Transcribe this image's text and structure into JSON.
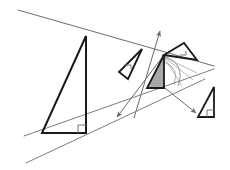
{
  "canvas": {
    "width": 230,
    "height": 170,
    "background": "#ffffff",
    "title": "Geometric transformation diagram with right triangles"
  },
  "style": {
    "stroke_dark": "#1a1a1a",
    "stroke_mid": "#555555",
    "stroke_light": "#7a7a7a",
    "shade_fill": "#a8a8a8",
    "shade_stroke": "#1a1a1a",
    "marker_stroke": "#777777",
    "thick_width": 2.0,
    "thin_width": 0.8,
    "hair_width": 0.6
  },
  "construction_lines": [
    {
      "name": "upper-guide-line",
      "x1": 18,
      "y1": 10,
      "x2": 214,
      "y2": 66,
      "color": "#5a5a5a",
      "width": 0.9
    },
    {
      "name": "lower-guide-line-upper",
      "x1": 24,
      "y1": 136,
      "x2": 214,
      "y2": 69,
      "color": "#6e6e6e",
      "width": 0.9
    },
    {
      "name": "lower-guide-line-lower",
      "x1": 26,
      "y1": 163,
      "x2": 205,
      "y2": 79,
      "color": "#6e6e6e",
      "width": 0.9
    }
  ],
  "triangles": [
    {
      "name": "large-left-triangle",
      "points": "42,133 86,133 86,36",
      "fill": "none",
      "stroke": "#1a1a1a",
      "width": 2.0,
      "right_angle": {
        "corner_x": 86,
        "corner_y": 133,
        "dx": -8,
        "dy": -8
      }
    },
    {
      "name": "small-outlined-triangle-left",
      "points": "119,72 142,49 128,79",
      "fill": "none",
      "stroke": "#1a1a1a",
      "width": 1.8,
      "right_angle": {
        "corner_x": 124,
        "corner_y": 69,
        "dx": 7,
        "dy": -4
      }
    },
    {
      "name": "shaded-center-triangle",
      "points": "147,88 164,88 164,55",
      "fill": "#a8a8a8",
      "stroke": "#1a1a1a",
      "width": 1.8,
      "right_angle": null
    },
    {
      "name": "tilted-upper-right-triangle",
      "points": "164,55 197,60 184,43",
      "fill": "none",
      "stroke": "#1a1a1a",
      "width": 1.8,
      "right_angle": {
        "corner_x": 180,
        "corner_y": 51,
        "dx": 6,
        "dy": 4
      }
    },
    {
      "name": "small-bottom-right-triangle",
      "points": "198,117 214,117 214,87",
      "fill": "none",
      "stroke": "#1a1a1a",
      "width": 1.8,
      "right_angle": {
        "corner_x": 214,
        "corner_y": 117,
        "dx": -7,
        "dy": -7
      }
    }
  ],
  "arrows": [
    {
      "name": "arrow-up-translation",
      "x1": 134,
      "y1": 118,
      "x2": 160,
      "y2": 31,
      "color": "#6b6b6b",
      "width": 1.0
    },
    {
      "name": "arrow-down-left-translation",
      "x1": 164,
      "y1": 55,
      "x2": 117,
      "y2": 117,
      "color": "#6b6b6b",
      "width": 1.0
    },
    {
      "name": "arrow-down-right-translation",
      "x1": 160,
      "y1": 84,
      "x2": 196,
      "y2": 113,
      "color": "#6b6b6b",
      "width": 1.0
    }
  ],
  "arcs": [
    {
      "name": "rotation-arc-outer",
      "path": "M 164,56 Q 186,64 178,86",
      "color": "#7a7a7a",
      "width": 0.8
    },
    {
      "name": "rotation-arc-inner",
      "path": "M 164,62 Q 180,68 174,84",
      "color": "#8a8a8a",
      "width": 0.7
    },
    {
      "name": "fan-line-a",
      "x1": 164,
      "y1": 57,
      "x2": 197,
      "y2": 73,
      "color": "#8a8a8a",
      "width": 0.6
    },
    {
      "name": "fan-line-b",
      "x1": 164,
      "y1": 57,
      "x2": 193,
      "y2": 80,
      "color": "#8a8a8a",
      "width": 0.6
    },
    {
      "name": "fan-line-c",
      "x1": 164,
      "y1": 57,
      "x2": 182,
      "y2": 86,
      "color": "#8a8a8a",
      "width": 0.6
    }
  ]
}
